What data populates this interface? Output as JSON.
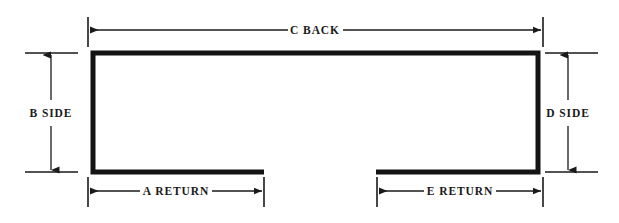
{
  "diagram": {
    "type": "engineering-dimension-drawing",
    "background_color": "#ffffff",
    "line_color": "#1a1a1a",
    "profile_stroke_color": "#141414",
    "profile_stroke_width": 5,
    "dimension_stroke_width": 1.3,
    "dimensions": [
      {
        "id": "c-back",
        "label": "C BACK",
        "orientation": "horizontal",
        "position": "top",
        "label_x": 315,
        "label_y": 30,
        "line_y": 30,
        "from_x": 90,
        "to_x": 541,
        "tick_x1": 88,
        "tick_x2": 543,
        "tick_top": 17,
        "tick_bottom": 47,
        "gap_half_width": 27
      },
      {
        "id": "b-side",
        "label": "B SIDE",
        "orientation": "vertical",
        "position": "left",
        "label_x": 51,
        "label_y": 113,
        "line_x": 51,
        "from_y": 53,
        "to_y": 172,
        "ext_x1": 25,
        "ext_x2": 78,
        "ext_y1": 53,
        "ext_y2": 172,
        "gap_half_height": 13
      },
      {
        "id": "d-side",
        "label": "D SIDE",
        "orientation": "vertical",
        "position": "right",
        "label_x": 568,
        "label_y": 113,
        "line_x": 568,
        "from_y": 53,
        "to_y": 172,
        "ext_x1": 545,
        "ext_x2": 598,
        "ext_y1": 53,
        "ext_y2": 172,
        "gap_half_height": 13
      },
      {
        "id": "a-return",
        "label": "A RETURN",
        "orientation": "horizontal",
        "position": "bottom-left",
        "label_x": 176,
        "label_y": 191,
        "line_y": 191,
        "from_x": 90,
        "to_x": 263,
        "tick_x1": 88,
        "tick_x2": 264,
        "tick_top": 177,
        "tick_bottom": 207,
        "gap_half_width": 36
      },
      {
        "id": "e-return",
        "label": "E RETURN",
        "orientation": "horizontal",
        "position": "bottom-right",
        "label_x": 460,
        "label_y": 191,
        "line_y": 191,
        "from_x": 378,
        "to_x": 541,
        "tick_x1": 377,
        "tick_x2": 543,
        "tick_top": 177,
        "tick_bottom": 207,
        "gap_half_width": 36
      }
    ],
    "profile": {
      "name": "c-channel-outline",
      "description": "Open C channel with back, two sides and two returns",
      "outer_left": 93,
      "outer_right": 538,
      "outer_top": 53,
      "outer_bottom": 172,
      "return_left_end": 264,
      "return_right_start": 376,
      "path": "M 264 172 L 93 172 L 93 53 L 538 53 L 538 172 L 376 172"
    }
  }
}
